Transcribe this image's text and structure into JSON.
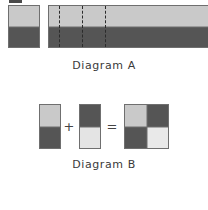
{
  "figure": {
    "title_a": "Diagram A",
    "title_b": "Diagram B",
    "background": "#ffffff"
  },
  "colors": {
    "light_gray": "#c9c9c9",
    "dark_gray": "#555555",
    "pale_gray": "#e4e4e4",
    "outline": "#6f6f6f",
    "dash": "#2b2b2b",
    "text": "#3a3a3a"
  },
  "diagram_a": {
    "label": "Diagram A",
    "unit_square": {
      "name": "unit-square",
      "top_fill": "#c9c9c9",
      "bottom_fill": "#555555",
      "top_fraction": "1/2",
      "bottom_fraction": "1/2"
    },
    "long_bar": {
      "name": "long-bar",
      "top_fill": "#c9c9c9",
      "bottom_fill": "#555555",
      "dashed_divisions": 3,
      "dash_positions_pct": [
        6.5,
        20.5,
        34.5
      ]
    }
  },
  "diagram_b": {
    "label": "Diagram B",
    "operand_1": {
      "name": "operand-square-1",
      "top_fill": "#c9c9c9",
      "bottom_fill": "#555555"
    },
    "operator_plus": "+",
    "operand_2": {
      "name": "operand-square-2",
      "top_fill": "#555555",
      "bottom_fill": "#e4e4e4"
    },
    "operator_equals": "=",
    "result": {
      "name": "result-square",
      "top_left_fill": "#c9c9c9",
      "top_right_fill": "#555555",
      "bottom_left_fill": "#555555",
      "bottom_right_fill": "#e9e9e9"
    }
  }
}
